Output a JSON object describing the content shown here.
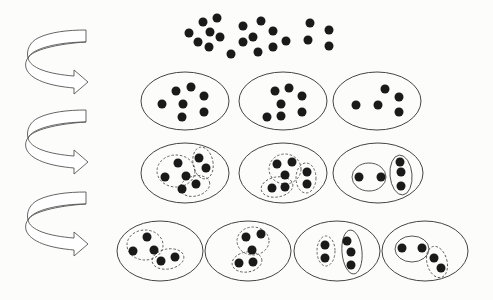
{
  "colors": {
    "background": "#fcfcfb",
    "dot": "#1a1a1a",
    "outline": "#444444",
    "dashed": "#555555",
    "arrow_fill": "#ffffff",
    "arrow_stroke": "#555555"
  },
  "dot_radius": 4.5,
  "top_cluster": {
    "dots": [
      [
        203,
        22
      ],
      [
        217,
        18
      ],
      [
        189,
        33
      ],
      [
        198,
        42
      ],
      [
        210,
        32
      ],
      [
        220,
        37
      ],
      [
        209,
        47
      ],
      [
        243,
        26
      ],
      [
        261,
        21
      ],
      [
        273,
        31
      ],
      [
        243,
        42
      ],
      [
        253,
        37
      ],
      [
        231,
        54
      ],
      [
        258,
        52
      ],
      [
        273,
        47
      ],
      [
        286,
        41
      ],
      [
        310,
        23
      ],
      [
        329,
        30
      ],
      [
        308,
        40
      ],
      [
        329,
        46
      ]
    ]
  },
  "arrows": [
    {
      "x": 20,
      "y": 28
    },
    {
      "x": 20,
      "y": 108
    },
    {
      "x": 20,
      "y": 190
    }
  ],
  "rows": [
    {
      "groups": [
        {
          "ellipse": {
            "cx": 185,
            "cy": 101,
            "rx": 44,
            "ry": 29
          },
          "dots": [
            [
              162,
              104
            ],
            [
              176,
              91
            ],
            [
              191,
              87
            ],
            [
              204,
              96
            ],
            [
              183,
              104
            ],
            [
              182,
              117
            ],
            [
              204,
              112
            ]
          ],
          "subgroups": []
        },
        {
          "ellipse": {
            "cx": 283,
            "cy": 101,
            "rx": 44,
            "ry": 29
          },
          "dots": [
            [
              275,
              91
            ],
            [
              289,
              88
            ],
            [
              302,
              96
            ],
            [
              281,
              104
            ],
            [
              267,
              117
            ],
            [
              281,
              116
            ],
            [
              302,
              112
            ]
          ],
          "subgroups": []
        },
        {
          "ellipse": {
            "cx": 377,
            "cy": 101,
            "rx": 44,
            "ry": 29
          },
          "dots": [
            [
              356,
              105
            ],
            [
              378,
              105
            ],
            [
              385,
              89
            ],
            [
              399,
              97
            ],
            [
              399,
              112
            ]
          ],
          "subgroups": []
        }
      ]
    },
    {
      "groups": [
        {
          "ellipse": {
            "cx": 185,
            "cy": 173,
            "rx": 44,
            "ry": 30
          },
          "dots": [
            [
              178,
              163
            ],
            [
              165,
              177
            ],
            [
              186,
              176
            ],
            [
              199,
              158
            ],
            [
              206,
              168
            ],
            [
              196,
              184
            ],
            [
              182,
              189
            ]
          ],
          "subgroups": [
            {
              "cx": 176,
              "cy": 171,
              "rx": 19,
              "ry": 16,
              "rot": 0,
              "dashed": true
            },
            {
              "cx": 203,
              "cy": 163,
              "rx": 10,
              "ry": 16,
              "rot": -10,
              "dashed": true
            },
            {
              "cx": 195,
              "cy": 186,
              "rx": 15,
              "ry": 10,
              "rot": -15,
              "dashed": true
            }
          ]
        },
        {
          "ellipse": {
            "cx": 283,
            "cy": 173,
            "rx": 44,
            "ry": 30
          },
          "dots": [
            [
              277,
              164
            ],
            [
              292,
              162
            ],
            [
              285,
              175
            ],
            [
              272,
              188
            ],
            [
              285,
              187
            ],
            [
              307,
              172
            ],
            [
              307,
              184
            ]
          ],
          "subgroups": [
            {
              "cx": 285,
              "cy": 169,
              "rx": 16,
              "ry": 15,
              "rot": 0,
              "dashed": true
            },
            {
              "cx": 306,
              "cy": 178,
              "rx": 10,
              "ry": 15,
              "rot": 0,
              "dashed": true
            },
            {
              "cx": 277,
              "cy": 187,
              "rx": 16,
              "ry": 10,
              "rot": -10,
              "dashed": true
            }
          ]
        },
        {
          "ellipse": {
            "cx": 378,
            "cy": 173,
            "rx": 45,
            "ry": 30
          },
          "dots": [
            [
              359,
              177
            ],
            [
              381,
              177
            ],
            [
              400,
              162
            ],
            [
              401,
              172
            ],
            [
              401,
              186
            ]
          ],
          "subgroups": [
            {
              "cx": 369,
              "cy": 177,
              "rx": 17,
              "ry": 14,
              "rot": 0,
              "dashed": false
            },
            {
              "cx": 401,
              "cy": 175,
              "rx": 11,
              "ry": 20,
              "rot": -5,
              "dashed": false
            }
          ]
        }
      ]
    },
    {
      "groups": [
        {
          "ellipse": {
            "cx": 160,
            "cy": 251,
            "rx": 43,
            "ry": 30
          },
          "dots": [
            [
              147,
              237
            ],
            [
              133,
              251
            ],
            [
              154,
              250
            ],
            [
              161,
              261
            ],
            [
              175,
              257
            ]
          ],
          "subgroups": [
            {
              "cx": 145,
              "cy": 245,
              "rx": 18,
              "ry": 15,
              "rot": 0,
              "dashed": true
            },
            {
              "cx": 168,
              "cy": 259,
              "rx": 16,
              "ry": 10,
              "rot": -10,
              "dashed": true
            }
          ]
        },
        {
          "ellipse": {
            "cx": 248,
            "cy": 251,
            "rx": 43,
            "ry": 30
          },
          "dots": [
            [
              246,
              237
            ],
            [
              261,
              234
            ],
            [
              252,
              250
            ],
            [
              239,
              263
            ],
            [
              253,
              262
            ]
          ],
          "subgroups": [
            {
              "cx": 253,
              "cy": 241,
              "rx": 16,
              "ry": 14,
              "rot": 0,
              "dashed": true
            },
            {
              "cx": 247,
              "cy": 262,
              "rx": 15,
              "ry": 10,
              "rot": -10,
              "dashed": true
            }
          ]
        },
        {
          "ellipse": {
            "cx": 337,
            "cy": 251,
            "rx": 43,
            "ry": 30
          },
          "dots": [
            [
              325,
              245
            ],
            [
              325,
              258
            ],
            [
              347,
              241
            ],
            [
              351,
              252
            ],
            [
              351,
              265
            ]
          ],
          "subgroups": [
            {
              "cx": 326,
              "cy": 251,
              "rx": 9,
              "ry": 15,
              "rot": 0,
              "dashed": true
            },
            {
              "cx": 352,
              "cy": 252,
              "rx": 10,
              "ry": 22,
              "rot": -5,
              "dashed": false
            }
          ]
        },
        {
          "ellipse": {
            "cx": 425,
            "cy": 251,
            "rx": 43,
            "ry": 30
          },
          "dots": [
            [
              402,
              248
            ],
            [
              422,
              248
            ],
            [
              434,
              258
            ],
            [
              441,
              268
            ]
          ],
          "subgroups": [
            {
              "cx": 412,
              "cy": 249,
              "rx": 17,
              "ry": 13,
              "rot": 0,
              "dashed": false
            },
            {
              "cx": 437,
              "cy": 262,
              "rx": 10,
              "ry": 16,
              "rot": -15,
              "dashed": true
            }
          ]
        }
      ]
    }
  ]
}
